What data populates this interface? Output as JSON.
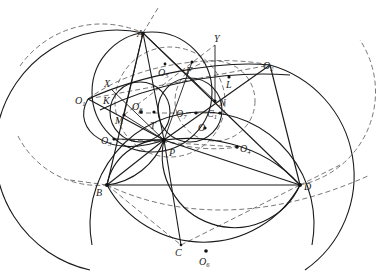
{
  "figure": {
    "type": "geometry-construction",
    "background": "#ffffff",
    "stroke_color": "#1a1a1a",
    "dash_color": "#555555"
  },
  "points": {
    "A": {
      "label": "A",
      "sub": "",
      "x": 143,
      "y": 33
    },
    "B": {
      "label": "B",
      "sub": "",
      "x": 107,
      "y": 185
    },
    "C": {
      "label": "C",
      "sub": "",
      "x": 181,
      "y": 245
    },
    "D": {
      "label": "D",
      "sub": "",
      "x": 300,
      "y": 185
    },
    "P": {
      "label": "P",
      "sub": "",
      "x": 164,
      "y": 140
    },
    "N": {
      "label": "N",
      "sub": "",
      "x": 215,
      "y": 101
    },
    "L": {
      "label": "L",
      "sub": "",
      "x": 229,
      "y": 77
    },
    "Y": {
      "label": "Y",
      "sub": "",
      "x": 215,
      "y": 45
    },
    "F": {
      "label": "F",
      "sub": "",
      "x": 192,
      "y": 62
    },
    "X": {
      "label": "X",
      "sub": "",
      "x": 111,
      "y": 89
    },
    "K": {
      "label": "K",
      "sub": "",
      "x": 111,
      "y": 100
    },
    "M": {
      "label": "M",
      "sub": "",
      "x": 124,
      "y": 115
    },
    "O": {
      "label": "O",
      "sub": "",
      "x": 205,
      "y": 128
    },
    "O1": {
      "label": "O",
      "sub": "1",
      "x": 88,
      "y": 99
    },
    "O2": {
      "label": "O",
      "sub": "2",
      "x": 270,
      "y": 65
    },
    "O3": {
      "label": "O",
      "sub": "3",
      "x": 114,
      "y": 139
    },
    "O4": {
      "label": "O",
      "sub": "4",
      "x": 237,
      "y": 147
    },
    "O5": {
      "label": "O",
      "sub": "5",
      "x": 165,
      "y": 64
    },
    "O6": {
      "label": "O",
      "sub": "6",
      "x": 206,
      "y": 251
    },
    "O7": {
      "label": "O",
      "sub": "7",
      "x": 196,
      "y": 113
    },
    "O8": {
      "label": "O",
      "sub": "8",
      "x": 138,
      "y": 113
    },
    "C1": {
      "label": "C",
      "sub": "1",
      "x": 220,
      "y": 113
    },
    "T": {
      "label": "T",
      "sub": "",
      "x": 155,
      "y": 120
    }
  },
  "label_positions": {
    "A": [
      137,
      37
    ],
    "B": [
      96,
      196
    ],
    "C": [
      175,
      255
    ],
    "D": [
      304,
      190
    ],
    "P": [
      169,
      155
    ],
    "N": [
      219,
      105
    ],
    "L": [
      226,
      87
    ],
    "Y": [
      215,
      42
    ],
    "F": [
      186,
      74
    ],
    "X": [
      105,
      86
    ],
    "K": [
      104,
      104
    ],
    "M": [
      116,
      123
    ],
    "O": [
      198,
      130
    ],
    "O1": [
      75,
      104
    ],
    "O2": [
      263,
      69
    ],
    "O3": [
      101,
      143
    ],
    "O4": [
      240,
      152
    ],
    "O5": [
      158,
      76
    ],
    "O6": [
      199,
      265
    ],
    "O7": [
      178,
      116
    ],
    "O8": [
      133,
      110
    ],
    "C1": [
      207,
      116
    ],
    "T": [
      150,
      128
    ]
  }
}
